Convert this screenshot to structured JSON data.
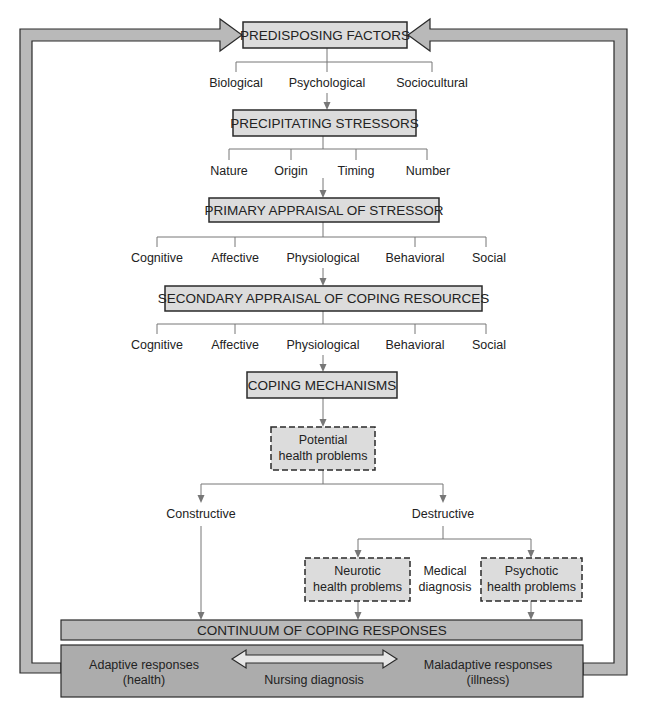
{
  "diagram": {
    "type": "flowchart",
    "colors": {
      "box_fill": "#dcdcdc",
      "box_stroke": "#2a2a2a",
      "frame_fill": "#b9b9b9",
      "bottom_fill": "#acacac",
      "line": "#777777",
      "arrow_fill": "#e6e6e6"
    },
    "nodes": {
      "predisposing": "PREDISPOSING FACTORS",
      "precipitating": "PRECIPITATING STRESSORS",
      "primary": "PRIMARY APPRAISAL OF STRESSOR",
      "secondary": "SECONDARY APPRAISAL OF COPING RESOURCES",
      "coping": "COPING MECHANISMS",
      "potential": [
        "Potential",
        "health problems"
      ],
      "neurotic": [
        "Neurotic",
        "health problems"
      ],
      "psychotic": [
        "Psychotic",
        "health problems"
      ],
      "continuum": "CONTINUUM OF COPING RESPONSES"
    },
    "predisposing_branches": [
      "Biological",
      "Psychological",
      "Sociocultural"
    ],
    "precipitating_branches": [
      "Nature",
      "Origin",
      "Timing",
      "Number"
    ],
    "primary_branches": [
      "Cognitive",
      "Affective",
      "Physiological",
      "Behavioral",
      "Social"
    ],
    "secondary_branches": [
      "Cognitive",
      "Affective",
      "Physiological",
      "Behavioral",
      "Social"
    ],
    "outcome_branches": [
      "Constructive",
      "Destructive"
    ],
    "medical_diagnosis": [
      "Medical",
      "diagnosis"
    ],
    "bottom": {
      "adaptive": [
        "Adaptive responses",
        "(health)"
      ],
      "maladaptive": [
        "Maladaptive responses",
        "(illness)"
      ],
      "nursing_diagnosis": "Nursing diagnosis"
    },
    "edges": [
      [
        "predisposing",
        "Psychological"
      ],
      [
        "Psychological",
        "precipitating"
      ],
      [
        "precipitating",
        "Origin/Timing"
      ],
      [
        "Origin/Timing",
        "primary"
      ],
      [
        "primary",
        "Physiological"
      ],
      [
        "Physiological",
        "secondary"
      ],
      [
        "secondary",
        "Physiological"
      ],
      [
        "Physiological",
        "coping"
      ],
      [
        "coping",
        "potential"
      ],
      [
        "potential",
        "Constructive"
      ],
      [
        "potential",
        "Destructive"
      ],
      [
        "Destructive",
        "neurotic"
      ],
      [
        "Destructive",
        "psychotic"
      ],
      [
        "Constructive",
        "continuum"
      ],
      [
        "neurotic",
        "continuum"
      ],
      [
        "psychotic",
        "continuum"
      ],
      [
        "bottom",
        "predisposing (feedback left)"
      ],
      [
        "bottom",
        "predisposing (feedback right)"
      ]
    ]
  }
}
